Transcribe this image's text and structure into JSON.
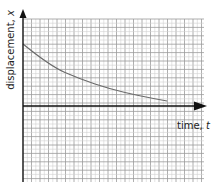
{
  "chart_data": {
    "type": "line",
    "title": "",
    "xlabel": "time, t",
    "ylabel": "displacement, x",
    "xlabel_parts": {
      "text": "time, ",
      "var": "t"
    },
    "ylabel_parts": {
      "text": "displacement, ",
      "var": "x"
    },
    "grid": true,
    "legend": null,
    "axis_ticks": "none",
    "series": [
      {
        "name": "displacement",
        "color": "#6b6b6b",
        "points_px": [
          [
            23,
            44
          ],
          [
            50,
            66
          ],
          [
            80,
            79
          ],
          [
            110,
            89
          ],
          [
            140,
            96
          ],
          [
            167,
            101
          ]
        ],
        "x_grid_units": [
          0,
          3.2,
          6.7,
          10.2,
          13.7,
          16.9
        ],
        "y_grid_units": [
          14.8,
          9.5,
          6.4,
          4.0,
          2.4,
          1.2
        ]
      }
    ],
    "layout": {
      "origin_px": [
        23,
        106
      ],
      "grid_left": 23,
      "grid_right": 204,
      "grid_top": 19,
      "grid_bottom": 182,
      "major_spacing_x": 8.5,
      "minor_spacing_y": 4.2
    },
    "colors": {
      "axis": "#111111",
      "grid_major": "#9a9a9a",
      "grid_minor": "#d0d0d0",
      "curve": "#6b6b6b"
    }
  }
}
